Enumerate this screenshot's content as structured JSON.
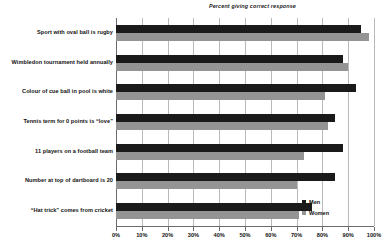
{
  "chart_data": {
    "type": "bar",
    "orientation": "horizontal",
    "title": "Percent giving correct response",
    "xlabel": "",
    "ylabel": "",
    "xlim": [
      0,
      100
    ],
    "xticks": [
      0,
      10,
      20,
      30,
      40,
      50,
      60,
      70,
      80,
      90,
      100
    ],
    "xticklabels": [
      "0%",
      "10%",
      "20%",
      "30%",
      "40%",
      "50%",
      "60%",
      "70%",
      "80%",
      "90%",
      "100%"
    ],
    "grid": true,
    "legend_position": "lower-right",
    "categories": [
      "Sport with oval ball is rugby",
      "Wimbledon tournament held annually",
      "Colour of cue ball in pool is white",
      "Tennis term for 0 points is “love”",
      "11 players on a football team",
      "Number at top of dartboard is 20",
      "“Hat trick” comes from cricket"
    ],
    "series": [
      {
        "name": "Men",
        "color": "#1a1a1a",
        "values": [
          95,
          88,
          93,
          85,
          88,
          85,
          76
        ]
      },
      {
        "name": "Women",
        "color": "#949494",
        "values": [
          98,
          90,
          81,
          82,
          73,
          70,
          71
        ]
      }
    ]
  }
}
